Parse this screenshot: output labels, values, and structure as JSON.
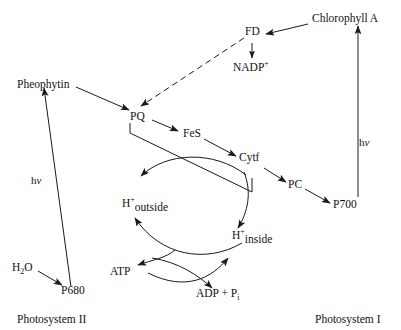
{
  "diagram": {
    "stroke_color": "#1a1a1a",
    "text_color": "#111111",
    "background": "#ffffff",
    "nodes": {
      "pheophytin": "Pheophytin",
      "pq": "PQ",
      "fes": "FeS",
      "cytf": "Cytf",
      "pc": "PC",
      "fd": "FD",
      "nadp": "NADP",
      "nadp_charge": "+",
      "chlorophyll_a": "Chlorophyll A",
      "p700": "P700",
      "p680": "P680",
      "water_h": "H",
      "water_sub": "2",
      "water_o": "O",
      "atp": "ATP",
      "adp_pi": "ADP + P",
      "adp_pi_sub": "i",
      "h_plus": "H",
      "h_plus_charge": "+",
      "h_outside": "outside",
      "h_inside": "inside"
    },
    "photon_labels": {
      "photosystem_ii": "hv",
      "photosystem_i": "hv",
      "h_char": "h",
      "nu_char": "v"
    },
    "system_labels": {
      "left": "Photosystem II",
      "right": "Photosystem I"
    }
  }
}
